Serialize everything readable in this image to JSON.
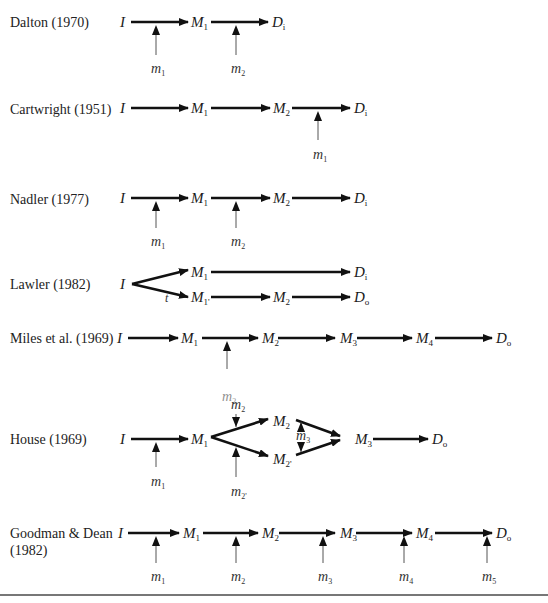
{
  "figure": {
    "rows": [
      {
        "id": "dalton",
        "label": "Dalton (1970)",
        "label_y": 14,
        "nodes": [
          {
            "base": "I",
            "sub": "",
            "x": 120,
            "y": 15
          },
          {
            "base": "M",
            "sub": "1",
            "x": 191,
            "y": 15
          },
          {
            "base": "D",
            "sub": "i",
            "x": 272,
            "y": 15
          }
        ],
        "arrows": [
          {
            "x1": 131,
            "y1": 22,
            "x2": 188,
            "y2": 22
          },
          {
            "x1": 211,
            "y1": 22,
            "x2": 268,
            "y2": 22
          }
        ],
        "moderators": [
          {
            "base": "m",
            "sub": "1",
            "x": 156,
            "arrow_from": 55,
            "arrow_to": 25,
            "label_y": 62
          },
          {
            "base": "m",
            "sub": "2",
            "x": 236,
            "arrow_from": 55,
            "arrow_to": 25,
            "label_y": 62
          }
        ]
      },
      {
        "id": "cartwright",
        "label": "Cartwright (1951)",
        "label_y": 101,
        "nodes": [
          {
            "base": "I",
            "sub": "",
            "x": 120,
            "y": 101
          },
          {
            "base": "M",
            "sub": "1",
            "x": 191,
            "y": 101
          },
          {
            "base": "M",
            "sub": "2",
            "x": 273,
            "y": 101
          },
          {
            "base": "D",
            "sub": "i",
            "x": 354,
            "y": 101
          }
        ],
        "arrows": [
          {
            "x1": 131,
            "y1": 108,
            "x2": 188,
            "y2": 108
          },
          {
            "x1": 211,
            "y1": 108,
            "x2": 270,
            "y2": 108
          },
          {
            "x1": 292,
            "y1": 108,
            "x2": 350,
            "y2": 108
          }
        ],
        "moderators": [
          {
            "base": "m",
            "sub": "1",
            "x": 318,
            "arrow_from": 140,
            "arrow_to": 111,
            "label_y": 148
          }
        ]
      },
      {
        "id": "nadler",
        "label": "Nadler (1977)",
        "label_y": 191,
        "nodes": [
          {
            "base": "I",
            "sub": "",
            "x": 120,
            "y": 191
          },
          {
            "base": "M",
            "sub": "1",
            "x": 191,
            "y": 191
          },
          {
            "base": "M",
            "sub": "2",
            "x": 273,
            "y": 191
          },
          {
            "base": "D",
            "sub": "i",
            "x": 354,
            "y": 191
          }
        ],
        "arrows": [
          {
            "x1": 131,
            "y1": 198,
            "x2": 188,
            "y2": 198
          },
          {
            "x1": 211,
            "y1": 198,
            "x2": 270,
            "y2": 198
          },
          {
            "x1": 292,
            "y1": 198,
            "x2": 350,
            "y2": 198
          }
        ],
        "moderators": [
          {
            "base": "m",
            "sub": "1",
            "x": 156,
            "arrow_from": 228,
            "arrow_to": 201,
            "label_y": 235
          },
          {
            "base": "m",
            "sub": "2",
            "x": 236,
            "arrow_from": 228,
            "arrow_to": 201,
            "label_y": 235
          }
        ]
      },
      {
        "id": "lawler",
        "label": "Lawler (1982)",
        "label_y": 276,
        "nodes": [
          {
            "base": "I",
            "sub": "",
            "x": 120,
            "y": 277
          },
          {
            "base": "M",
            "sub": "1",
            "x": 191,
            "y": 265
          },
          {
            "base": "M",
            "sub": "1'",
            "x": 191,
            "y": 290
          },
          {
            "base": "M",
            "sub": "2",
            "x": 273,
            "y": 290
          },
          {
            "base": "D",
            "sub": "i",
            "x": 354,
            "y": 265
          },
          {
            "base": "D",
            "sub": "o",
            "x": 354,
            "y": 290
          }
        ],
        "arrows": [
          {
            "x1": 132,
            "y1": 284,
            "x2": 188,
            "y2": 270
          },
          {
            "x1": 132,
            "y1": 284,
            "x2": 188,
            "y2": 297
          },
          {
            "x1": 211,
            "y1": 272,
            "x2": 350,
            "y2": 272
          },
          {
            "x1": 211,
            "y1": 297,
            "x2": 270,
            "y2": 297
          },
          {
            "x1": 292,
            "y1": 297,
            "x2": 350,
            "y2": 297
          }
        ],
        "annotations": [
          {
            "text": "t",
            "x": 165,
            "y": 291
          }
        ],
        "moderators": []
      },
      {
        "id": "miles",
        "label": "Miles et al. (1969)",
        "label_y": 330,
        "nodes": [
          {
            "base": "I",
            "sub": "",
            "x": 117,
            "y": 331
          },
          {
            "base": "M",
            "sub": "1",
            "x": 181,
            "y": 331
          },
          {
            "base": "M",
            "sub": "2",
            "x": 262,
            "y": 331
          },
          {
            "base": "M",
            "sub": "3",
            "x": 340,
            "y": 331
          },
          {
            "base": "M",
            "sub": "4",
            "x": 416,
            "y": 331
          },
          {
            "base": "D",
            "sub": "o",
            "x": 496,
            "y": 331
          }
        ],
        "arrows": [
          {
            "x1": 128,
            "y1": 338,
            "x2": 178,
            "y2": 338
          },
          {
            "x1": 202,
            "y1": 338,
            "x2": 258,
            "y2": 338
          },
          {
            "x1": 278,
            "y1": 338,
            "x2": 335,
            "y2": 338
          },
          {
            "x1": 357,
            "y1": 338,
            "x2": 412,
            "y2": 338
          },
          {
            "x1": 435,
            "y1": 338,
            "x2": 492,
            "y2": 338
          }
        ],
        "moderators": [
          {
            "base": "m",
            "sub": "2",
            "x": 227,
            "arrow_from": 369,
            "arrow_to": 341,
            "label_y": 390,
            "faint": true
          }
        ]
      },
      {
        "id": "house",
        "label": "House (1969)",
        "label_y": 431,
        "nodes": [
          {
            "base": "I",
            "sub": "",
            "x": 120,
            "y": 432
          },
          {
            "base": "M",
            "sub": "1",
            "x": 191,
            "y": 432
          },
          {
            "base": "M",
            "sub": "2",
            "x": 273,
            "y": 414
          },
          {
            "base": "M",
            "sub": "2'",
            "x": 273,
            "y": 452
          },
          {
            "base": "M",
            "sub": "3",
            "x": 355,
            "y": 432
          },
          {
            "base": "D",
            "sub": "o",
            "x": 432,
            "y": 432
          }
        ],
        "arrows": [
          {
            "x1": 131,
            "y1": 439,
            "x2": 188,
            "y2": 439
          },
          {
            "x1": 211,
            "y1": 437,
            "x2": 268,
            "y2": 419
          },
          {
            "x1": 211,
            "y1": 437,
            "x2": 268,
            "y2": 456
          },
          {
            "x1": 296,
            "y1": 420,
            "x2": 340,
            "y2": 436
          },
          {
            "x1": 296,
            "y1": 455,
            "x2": 340,
            "y2": 440
          },
          {
            "x1": 373,
            "y1": 439,
            "x2": 428,
            "y2": 439
          }
        ],
        "moderators": [
          {
            "base": "m",
            "sub": "1",
            "x": 156,
            "arrow_from": 467,
            "arrow_to": 442,
            "label_y": 475
          },
          {
            "base": "m",
            "sub": "2",
            "x": 236,
            "arrow_from": 414,
            "arrow_to": 427,
            "label_y": 398,
            "direction": "down"
          },
          {
            "base": "m",
            "sub": "2'",
            "x": 236,
            "arrow_from": 477,
            "arrow_to": 447,
            "label_y": 485
          },
          {
            "base": "m",
            "sub": "3",
            "x": 301,
            "arrow_from": 432,
            "arrow_to": 422,
            "label_y": 429,
            "direction": "both",
            "arrow_from2": 442,
            "arrow_to2": 452
          }
        ]
      },
      {
        "id": "goodman-dean",
        "label": "Goodman & Dean\n(1982)",
        "label_line1": "Goodman & Dean",
        "label_line2": "(1982)",
        "label_y": 525,
        "nodes": [
          {
            "base": "I",
            "sub": "",
            "x": 118,
            "y": 526
          },
          {
            "base": "M",
            "sub": "1",
            "x": 183,
            "y": 526
          },
          {
            "base": "M",
            "sub": "2",
            "x": 262,
            "y": 526
          },
          {
            "base": "M",
            "sub": "3",
            "x": 340,
            "y": 526
          },
          {
            "base": "M",
            "sub": "4",
            "x": 416,
            "y": 526
          },
          {
            "base": "D",
            "sub": "o",
            "x": 496,
            "y": 526
          }
        ],
        "arrows": [
          {
            "x1": 128,
            "y1": 533,
            "x2": 179,
            "y2": 533
          },
          {
            "x1": 203,
            "y1": 533,
            "x2": 258,
            "y2": 533
          },
          {
            "x1": 279,
            "y1": 533,
            "x2": 335,
            "y2": 533
          },
          {
            "x1": 356,
            "y1": 533,
            "x2": 412,
            "y2": 533
          },
          {
            "x1": 435,
            "y1": 533,
            "x2": 492,
            "y2": 533
          }
        ],
        "moderators": [
          {
            "base": "m",
            "sub": "1",
            "x": 156,
            "arrow_from": 563,
            "arrow_to": 536,
            "label_y": 570
          },
          {
            "base": "m",
            "sub": "2",
            "x": 236,
            "arrow_from": 563,
            "arrow_to": 536,
            "label_y": 570
          },
          {
            "base": "m",
            "sub": "3",
            "x": 323,
            "arrow_from": 563,
            "arrow_to": 536,
            "label_y": 570
          },
          {
            "base": "m",
            "sub": "4",
            "x": 404,
            "arrow_from": 563,
            "arrow_to": 536,
            "label_y": 570
          },
          {
            "base": "m",
            "sub": "5",
            "x": 487,
            "arrow_from": 563,
            "arrow_to": 536,
            "label_y": 570
          }
        ]
      }
    ],
    "colors": {
      "arrow": "#111111",
      "moderator_arrow": "#555555",
      "rule": "#777777"
    }
  }
}
